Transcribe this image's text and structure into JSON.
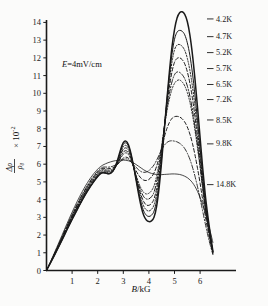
{
  "figure": {
    "background_color": "#fbfbfa",
    "ink_color": "#1a1a1a"
  },
  "annotations": {
    "field_condition": "E=4mV/cm",
    "field_condition_italic_part": "E",
    "field_condition_rest": "=4mV/cm"
  },
  "axes": {
    "x": {
      "title": "B/kG",
      "title_italic_part": "B",
      "title_rest": "/kG",
      "ticks": [
        1,
        2,
        3,
        4,
        5,
        6
      ],
      "tick_labels": [
        "1",
        "2",
        "3",
        "4",
        "5",
        "6"
      ],
      "range": [
        0,
        6.8
      ]
    },
    "y": {
      "title_numerator": "Δρ",
      "title_denominator": "ρ₀",
      "title_factor": "× 10",
      "title_exponent": "-2",
      "ticks": [
        0,
        1,
        2,
        3,
        4,
        5,
        6,
        7,
        8,
        9,
        10,
        11,
        12,
        13,
        14
      ],
      "tick_labels": [
        "0",
        "1",
        "2",
        "3",
        "4",
        "5",
        "6",
        "7",
        "8",
        "9",
        "10",
        "11",
        "12",
        "13",
        "14"
      ],
      "range": [
        0,
        14.9
      ]
    }
  },
  "chart_data": {
    "type": "line",
    "title": "",
    "subtitle": "",
    "xlabel": "B/kG",
    "ylabel": "Δρ/ρ₀ × 10⁻²",
    "xlim": [
      0,
      6.8
    ],
    "ylim": [
      0,
      14.9
    ],
    "grid": false,
    "legend_position": "right-inline-labels",
    "annotation": "E=4mV/cm",
    "x": [
      0,
      0.2,
      0.4,
      0.6,
      0.8,
      1.0,
      1.2,
      1.4,
      1.6,
      1.8,
      2.0,
      2.1,
      2.2,
      2.3,
      2.4,
      2.5,
      2.6,
      2.7,
      2.8,
      2.9,
      3.0,
      3.1,
      3.2,
      3.3,
      3.4,
      3.5,
      3.6,
      3.7,
      3.8,
      3.9,
      4.0,
      4.1,
      4.2,
      4.3,
      4.4,
      4.5,
      4.6,
      4.7,
      4.8,
      4.9,
      5.0,
      5.1,
      5.2,
      5.3,
      5.4,
      5.5,
      5.6,
      5.7,
      5.8,
      5.9,
      6.0,
      6.1,
      6.2,
      6.3,
      6.4,
      6.5
    ],
    "series": [
      {
        "name": "4.2K",
        "label": "4.2K",
        "linestyle": "solid",
        "linewidth": 1.5,
        "label_y": 14.05,
        "peak_main": 14.6,
        "values": [
          0,
          0.55,
          1.12,
          1.7,
          2.3,
          2.88,
          3.44,
          3.98,
          4.48,
          4.92,
          5.3,
          5.45,
          5.52,
          5.5,
          5.46,
          5.48,
          5.62,
          5.92,
          6.35,
          6.85,
          7.22,
          7.3,
          7.1,
          6.6,
          5.9,
          5.1,
          4.3,
          3.6,
          3.1,
          2.85,
          2.76,
          2.8,
          3.0,
          3.6,
          4.7,
          6.2,
          7.9,
          9.6,
          11.2,
          12.6,
          13.6,
          14.25,
          14.55,
          14.6,
          14.45,
          14.05,
          13.3,
          12.2,
          10.8,
          9.2,
          7.5,
          5.8,
          4.3,
          3.1,
          2.05,
          1.1
        ]
      },
      {
        "name": "4.7K",
        "label": "4.7K",
        "linestyle": "solid",
        "linewidth": 1.0,
        "label_y": 13.05,
        "peak_main": 13.55,
        "values": [
          0,
          0.55,
          1.12,
          1.7,
          2.3,
          2.88,
          3.44,
          3.98,
          4.48,
          4.92,
          5.3,
          5.45,
          5.52,
          5.5,
          5.46,
          5.48,
          5.6,
          5.88,
          6.28,
          6.75,
          7.12,
          7.2,
          7.02,
          6.55,
          5.9,
          5.15,
          4.42,
          3.8,
          3.35,
          3.12,
          3.05,
          3.12,
          3.35,
          3.95,
          5.0,
          6.4,
          8.0,
          9.55,
          11.0,
          12.2,
          13.05,
          13.45,
          13.55,
          13.5,
          13.3,
          12.85,
          12.15,
          11.15,
          9.9,
          8.45,
          6.9,
          5.35,
          3.95,
          2.85,
          1.9,
          1.05
        ]
      },
      {
        "name": "5.2K",
        "label": "5.2K",
        "linestyle": "dotted",
        "linewidth": 1.0,
        "label_y": 12.15,
        "peak_main": 12.75,
        "values": [
          0,
          0.56,
          1.14,
          1.73,
          2.33,
          2.92,
          3.48,
          4.02,
          4.52,
          4.96,
          5.34,
          5.48,
          5.55,
          5.53,
          5.5,
          5.52,
          5.62,
          5.88,
          6.22,
          6.65,
          6.98,
          7.06,
          6.9,
          6.48,
          5.88,
          5.22,
          4.58,
          4.02,
          3.62,
          3.42,
          3.36,
          3.45,
          3.7,
          4.3,
          5.3,
          6.6,
          8.05,
          9.45,
          10.7,
          11.75,
          12.45,
          12.72,
          12.75,
          12.65,
          12.42,
          11.98,
          11.3,
          10.4,
          9.25,
          7.95,
          6.55,
          5.1,
          3.8,
          2.75,
          1.85,
          1.05
        ]
      },
      {
        "name": "5.7K",
        "label": "5.7K",
        "linestyle": "dashed",
        "linewidth": 1.0,
        "label_y": 11.25,
        "peak_main": 12.0,
        "values": [
          0,
          0.57,
          1.16,
          1.76,
          2.37,
          2.96,
          3.53,
          4.07,
          4.57,
          5.01,
          5.38,
          5.52,
          5.58,
          5.57,
          5.54,
          5.56,
          5.64,
          5.86,
          6.16,
          6.54,
          6.84,
          6.92,
          6.78,
          6.4,
          5.86,
          5.26,
          4.7,
          4.22,
          3.88,
          3.7,
          3.68,
          3.78,
          4.04,
          4.62,
          5.55,
          6.75,
          8.05,
          9.3,
          10.35,
          11.2,
          11.75,
          11.97,
          12.0,
          11.9,
          11.66,
          11.22,
          10.58,
          9.72,
          8.68,
          7.5,
          6.25,
          4.9,
          3.68,
          2.68,
          1.8,
          1.03
        ]
      },
      {
        "name": "6.5K",
        "label": "6.5K",
        "linestyle": "dashdot",
        "linewidth": 1.0,
        "label_y": 10.35,
        "peak_main": 11.2,
        "values": [
          0,
          0.58,
          1.18,
          1.79,
          2.41,
          3.01,
          3.58,
          4.13,
          4.63,
          5.07,
          5.44,
          5.58,
          5.64,
          5.63,
          5.6,
          5.62,
          5.68,
          5.86,
          6.1,
          6.42,
          6.68,
          6.76,
          6.64,
          6.32,
          5.84,
          5.32,
          4.84,
          4.44,
          4.16,
          4.04,
          4.04,
          4.16,
          4.42,
          4.98,
          5.84,
          6.92,
          8.05,
          9.1,
          9.98,
          10.64,
          11.05,
          11.2,
          11.18,
          11.05,
          10.82,
          10.42,
          9.84,
          9.06,
          8.12,
          7.06,
          5.92,
          4.7,
          3.55,
          2.6,
          1.75,
          1.0
        ]
      },
      {
        "name": "7.2K",
        "label": "7.2K",
        "linestyle": "dotted",
        "linewidth": 0.9,
        "label_y": 9.5,
        "peak_main": 10.75,
        "values": [
          0,
          0.59,
          1.2,
          1.82,
          2.45,
          3.06,
          3.64,
          4.19,
          4.69,
          5.13,
          5.5,
          5.64,
          5.7,
          5.69,
          5.66,
          5.68,
          5.72,
          5.86,
          6.06,
          6.34,
          6.56,
          6.64,
          6.54,
          6.26,
          5.84,
          5.38,
          4.96,
          4.62,
          4.4,
          4.32,
          4.36,
          4.5,
          4.78,
          5.32,
          6.1,
          7.05,
          8.05,
          8.95,
          9.68,
          10.22,
          10.56,
          10.72,
          10.75,
          10.64,
          10.42,
          10.04,
          9.5,
          8.78,
          7.9,
          6.9,
          5.82,
          4.64,
          3.52,
          2.58,
          1.74,
          1.0
        ]
      },
      {
        "name": "8.5K",
        "label": "8.5K",
        "linestyle": "dashed",
        "linewidth": 1.0,
        "label_y": 8.35,
        "peak_main": 8.7,
        "values": [
          0,
          0.6,
          1.22,
          1.85,
          2.49,
          3.11,
          3.7,
          4.25,
          4.75,
          5.19,
          5.56,
          5.7,
          5.76,
          5.76,
          5.74,
          5.76,
          5.8,
          5.9,
          6.02,
          6.2,
          6.34,
          6.4,
          6.34,
          6.16,
          5.9,
          5.62,
          5.38,
          5.2,
          5.1,
          5.08,
          5.14,
          5.28,
          5.5,
          5.88,
          6.38,
          6.95,
          7.52,
          8.0,
          8.35,
          8.58,
          8.68,
          8.7,
          8.66,
          8.56,
          8.38,
          8.1,
          7.7,
          7.18,
          6.52,
          5.76,
          4.92,
          4.0,
          3.1,
          2.3,
          1.58,
          0.95
        ]
      },
      {
        "name": "9.8K",
        "label": "9.8K",
        "linestyle": "dashdot",
        "linewidth": 0.9,
        "label_y": 7.0,
        "peak_main": 7.3,
        "values": [
          0,
          0.61,
          1.24,
          1.88,
          2.53,
          3.16,
          3.76,
          4.31,
          4.81,
          5.25,
          5.62,
          5.76,
          5.83,
          5.84,
          5.83,
          5.85,
          5.89,
          5.96,
          6.05,
          6.17,
          6.26,
          6.3,
          6.26,
          6.14,
          5.98,
          5.82,
          5.68,
          5.58,
          5.54,
          5.56,
          5.64,
          5.78,
          5.96,
          6.22,
          6.52,
          6.82,
          7.06,
          7.22,
          7.3,
          7.32,
          7.3,
          7.26,
          7.18,
          7.06,
          6.88,
          6.62,
          6.28,
          5.84,
          5.32,
          4.72,
          4.06,
          3.36,
          2.66,
          2.0,
          1.42,
          0.9
        ]
      },
      {
        "name": "14.8K",
        "label": "14.8K",
        "linestyle": "solid",
        "linewidth": 0.8,
        "label_y": 4.7,
        "peak_main": 5.45,
        "values": [
          0,
          0.64,
          1.3,
          1.97,
          2.64,
          3.29,
          3.9,
          4.46,
          4.96,
          5.38,
          5.72,
          5.85,
          5.95,
          6.02,
          6.08,
          6.13,
          6.17,
          6.2,
          6.22,
          6.23,
          6.23,
          6.22,
          6.19,
          6.14,
          6.07,
          5.98,
          5.88,
          5.78,
          5.68,
          5.6,
          5.53,
          5.48,
          5.44,
          5.42,
          5.41,
          5.41,
          5.42,
          5.43,
          5.44,
          5.45,
          5.45,
          5.44,
          5.42,
          5.38,
          5.32,
          5.24,
          5.12,
          4.96,
          4.74,
          4.46,
          4.12,
          3.72,
          3.26,
          2.74,
          2.18,
          1.58
        ]
      }
    ]
  }
}
